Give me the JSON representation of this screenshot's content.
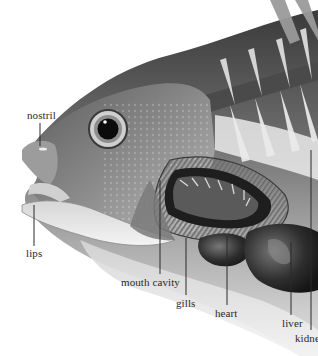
{
  "diagram": {
    "style": "grayscale illustration",
    "labels": [
      {
        "id": "nostril",
        "text": "nostril",
        "x": 27,
        "y": 110,
        "line": [
          40,
          123,
          40,
          146
        ]
      },
      {
        "id": "lips",
        "text": "lips",
        "x": 26,
        "y": 248,
        "line": [
          34,
          205,
          34,
          246
        ]
      },
      {
        "id": "mouth-cavity",
        "text": "mouth cavity",
        "x": 121,
        "y": 277,
        "line": [
          160,
          180,
          160,
          274
        ]
      },
      {
        "id": "gills",
        "text": "gills",
        "x": 176,
        "y": 298,
        "line": [
          186,
          238,
          186,
          295
        ]
      },
      {
        "id": "heart",
        "text": "heart",
        "x": 215,
        "y": 308,
        "line": [
          227,
          236,
          227,
          305
        ]
      },
      {
        "id": "liver",
        "text": "liver",
        "x": 282,
        "y": 318,
        "line": [
          291,
          242,
          291,
          315
        ]
      },
      {
        "id": "kidney",
        "text": "kidne",
        "x": 295,
        "y": 333,
        "line": [
          311,
          150,
          311,
          330
        ]
      }
    ]
  }
}
